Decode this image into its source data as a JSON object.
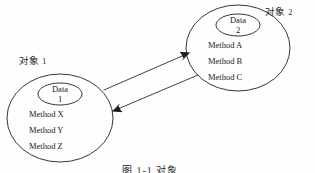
{
  "figure": {
    "background_color": "#ffffff",
    "ink_color": "#1a1a1a",
    "caption": "图 1-1  对象",
    "caption_visible_note": "clipped at bottom edge"
  },
  "objects": [
    {
      "id": "object-1",
      "label_text": "对象",
      "label_number": "1",
      "data_title": "Data",
      "data_number": "1",
      "methods": [
        "Method  X",
        "Method  Y",
        "Method  Z"
      ],
      "outer_ellipse": {
        "cx": 60,
        "cy": 118,
        "rx": 53,
        "ry": 44
      },
      "inner_ellipse": {
        "cx": 60,
        "cy": 94,
        "rx": 22,
        "ry": 11
      }
    },
    {
      "id": "object-2",
      "label_text": "对象",
      "label_number": "2",
      "data_title": "Data",
      "data_number": "2",
      "methods": [
        "Method  A",
        "Method  B",
        "Method  C"
      ],
      "outer_ellipse": {
        "cx": 238,
        "cy": 48,
        "rx": 52,
        "ry": 43
      },
      "inner_ellipse": {
        "cx": 238,
        "cy": 25,
        "rx": 22,
        "ry": 11
      }
    }
  ],
  "connectors": [
    {
      "id": "arrow-to-object-2",
      "direction": "object-1 to object-2",
      "from": {
        "x": 105,
        "y": 90
      },
      "to": {
        "x": 190,
        "y": 53
      }
    },
    {
      "id": "arrow-to-object-1",
      "direction": "object-2 to object-1",
      "from": {
        "x": 197,
        "y": 75
      },
      "to": {
        "x": 112,
        "y": 111
      }
    }
  ]
}
